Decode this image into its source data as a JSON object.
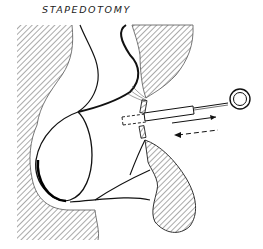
{
  "diagram": {
    "title": "STAPEDOTOMY",
    "parts": [
      {
        "name": "bone-left",
        "style": "hatched"
      },
      {
        "name": "bone-upper-right",
        "style": "hatched"
      },
      {
        "name": "bone-lower-right",
        "style": "hatched"
      },
      {
        "name": "tympanic-membrane",
        "style": "outline"
      },
      {
        "name": "stapes-footplate",
        "style": "hatched"
      },
      {
        "name": "piston-prosthesis",
        "style": "outline"
      },
      {
        "name": "piston-hole-outline",
        "style": "dashed"
      },
      {
        "name": "insertion-arrow",
        "direction": "right",
        "style": "solid"
      },
      {
        "name": "removal-arrow",
        "direction": "left",
        "style": "dashed"
      },
      {
        "name": "wire-loop",
        "style": "outline"
      }
    ],
    "colors": {
      "ink": "#111111",
      "hatch": "#555555",
      "background": "#ffffff"
    }
  }
}
